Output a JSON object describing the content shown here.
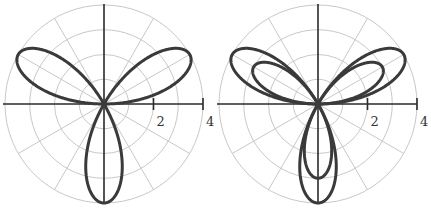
{
  "chart_data": [
    {
      "type": "polar",
      "title": "",
      "equation_note": "three-petal rose r = 4 sin(3θ)",
      "series": [
        {
          "name": "rose",
          "a": 4,
          "k": 3,
          "function": "sin"
        }
      ],
      "radial_ticks": [
        "2",
        "4"
      ],
      "rmax": 4,
      "grid": {
        "rings": [
          1,
          2,
          3,
          4
        ],
        "spokes_deg": 30
      },
      "center_px": [
        104,
        104
      ],
      "radius_px": 99
    },
    {
      "type": "polar",
      "title": "",
      "equation_note": "two nested three-petal roses",
      "series": [
        {
          "name": "outer-rose",
          "a": 4,
          "k": 3,
          "function": "sin"
        },
        {
          "name": "inner-rose",
          "a": 3,
          "k": 3,
          "function": "sin"
        }
      ],
      "radial_ticks": [
        "2",
        "4"
      ],
      "rmax": 4,
      "grid": {
        "rings": [
          1,
          2,
          3,
          4
        ],
        "spokes_deg": 30
      },
      "center_px": [
        318,
        104
      ],
      "radius_px": 99
    }
  ]
}
